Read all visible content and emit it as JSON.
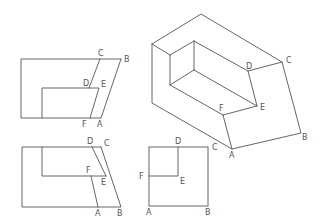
{
  "figure": {
    "line_color": "#555555",
    "background": "#ffffff"
  },
  "views": [
    {
      "id": "front-view",
      "labels": [
        "C",
        "B",
        "D",
        "E",
        "F",
        "A"
      ]
    },
    {
      "id": "top-view",
      "labels": [
        "D",
        "C",
        "F",
        "E",
        "A",
        "B"
      ]
    },
    {
      "id": "side-view",
      "labels": [
        "D",
        "C",
        "F",
        "E",
        "A",
        "B"
      ]
    },
    {
      "id": "isometric-view",
      "labels": [
        "D",
        "C",
        "F",
        "E",
        "A",
        "B"
      ]
    }
  ],
  "labels": {
    "front": {
      "C": "C",
      "B": "B",
      "D": "D",
      "E": "E",
      "F": "F",
      "A": "A"
    },
    "top": {
      "D": "D",
      "C": "C",
      "F": "F",
      "E": "E",
      "A": "A",
      "B": "B"
    },
    "side": {
      "D": "D",
      "C": "C",
      "F": "F",
      "E": "E",
      "A": "A",
      "B": "B"
    },
    "iso": {
      "D": "D",
      "C": "C",
      "F": "F",
      "E": "E",
      "A": "A",
      "B": "B"
    }
  }
}
